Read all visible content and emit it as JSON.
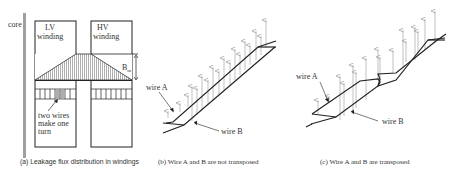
{
  "panels": {
    "a": {
      "core_label": "core",
      "lv_label_1": "LV",
      "lv_label_2": "winding",
      "hv_label_1": "HV",
      "hv_label_2": "winding",
      "bm_label": "B",
      "bm_sub": "m",
      "note_1": "two wires",
      "note_2": "make one",
      "note_3": "turn",
      "caption": "(a) Leakage flux distribution in windings"
    },
    "b": {
      "wire_a": "wire A",
      "wire_b": "wire B",
      "caption": "(b) Wire A and B are not transposed"
    },
    "c": {
      "wire_a": "wire A",
      "wire_b": "wire B",
      "caption": "(c) Wire A and B are transposed"
    }
  },
  "colors": {
    "line": "#222222",
    "arrow": "#999999",
    "core": "#a0a0a0",
    "hatch": "#777777",
    "text": "#333333"
  }
}
